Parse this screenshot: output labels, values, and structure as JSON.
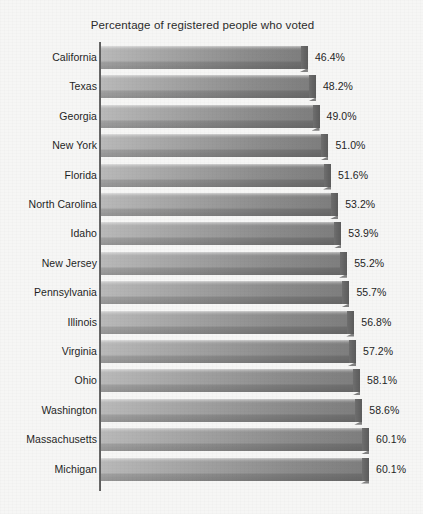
{
  "chart": {
    "title": "Percentage of registered people who voted",
    "axis_line_name": "category-axis"
  },
  "chart_data": {
    "type": "bar",
    "orientation": "horizontal",
    "title": "Percentage of registered people who voted",
    "xlabel": "",
    "ylabel": "",
    "xlim": [
      0,
      65
    ],
    "grid": false,
    "legend": false,
    "value_suffix": "%",
    "sort": "ascending",
    "categories": [
      "California",
      "Texas",
      "Georgia",
      "New York",
      "Florida",
      "North Carolina",
      "Idaho",
      "New Jersey",
      "Pennsylvania",
      "Illinois",
      "Virginia",
      "Ohio",
      "Washington",
      "Massachusetts",
      "Michigan"
    ],
    "values": [
      46.4,
      48.2,
      49.0,
      51.0,
      51.6,
      53.2,
      53.9,
      55.2,
      55.7,
      56.8,
      57.2,
      58.1,
      58.6,
      60.1,
      60.1
    ],
    "labels": [
      "46.4%",
      "48.2%",
      "49.0%",
      "51.0%",
      "51.6%",
      "53.2%",
      "53.9%",
      "55.2%",
      "55.7%",
      "56.8%",
      "57.2%",
      "58.1%",
      "58.6%",
      "60.1%",
      "60.1%"
    ],
    "colors": {
      "bar_gradient_start": "#b9b9b9",
      "bar_gradient_end": "#7e7e7e",
      "bar_end_face": "#636363",
      "axis": "#4a4a4a",
      "text": "#1f1f1f",
      "background": "#f6f6f5"
    }
  }
}
